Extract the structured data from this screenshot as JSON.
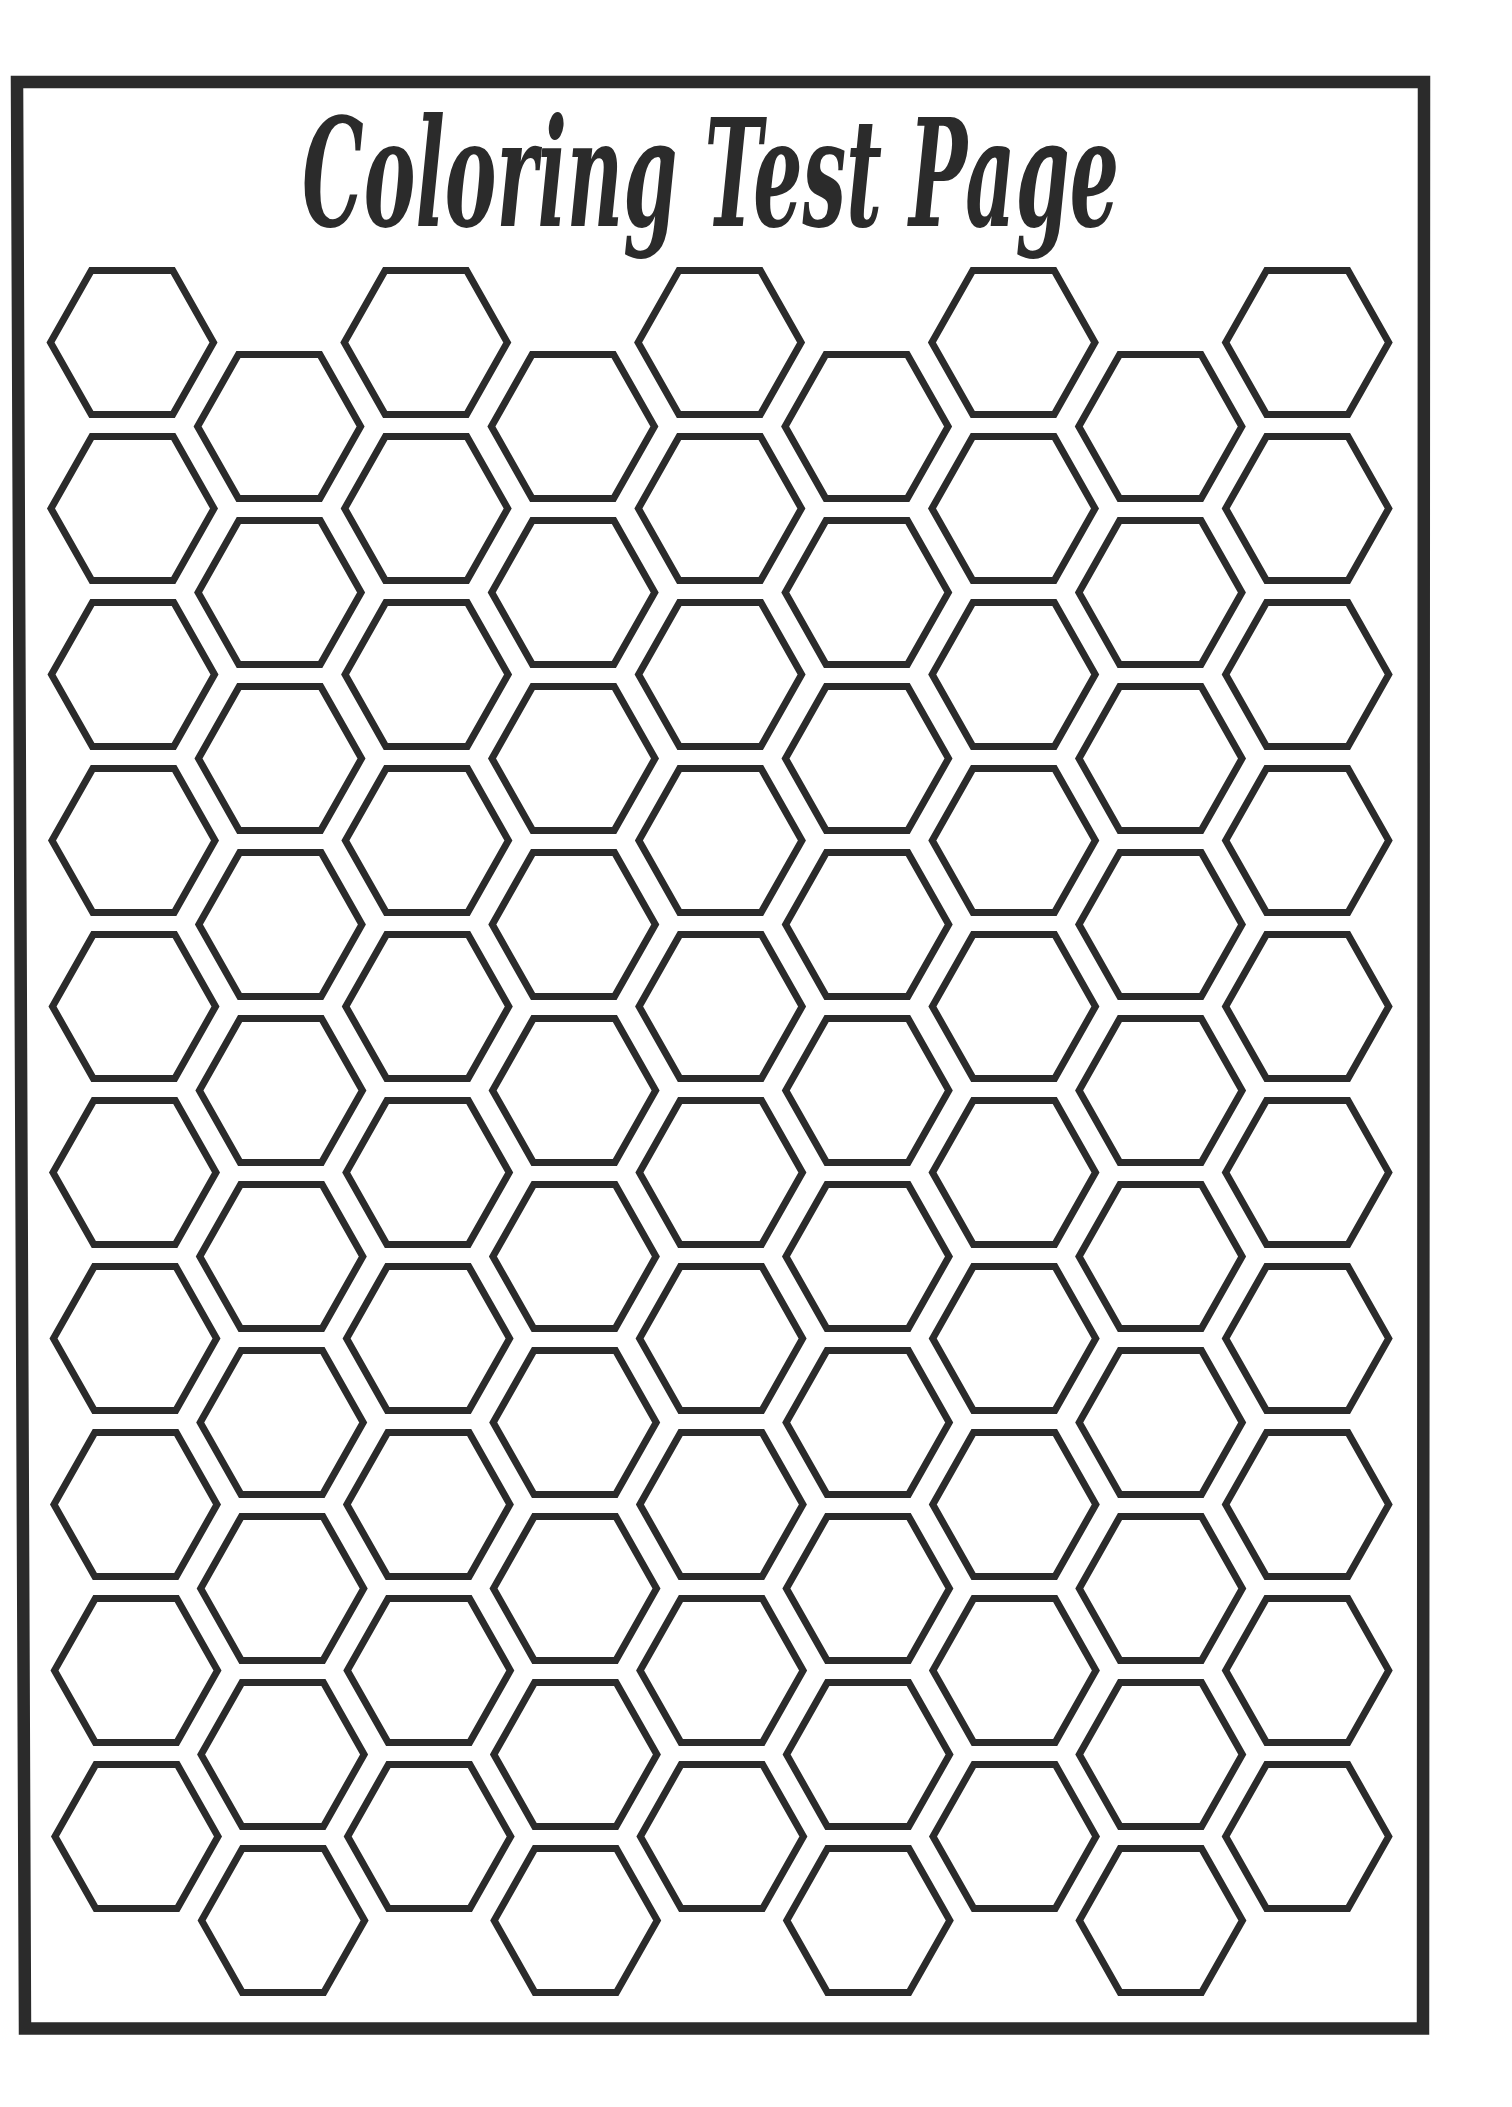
{
  "page": {
    "title": "Coloring Test Page",
    "colors": {
      "ink": "#2b2b2b",
      "paper": "#ffffff"
    }
  },
  "frame": {
    "points": [
      [
        17,
        82
      ],
      [
        1424,
        82
      ],
      [
        1423,
        2028.5
      ],
      [
        25,
        2028.5
      ]
    ],
    "stroke_width": 12.5
  },
  "title_layout": {
    "x": 302,
    "baseline_y": 226,
    "width": 817
  },
  "hex_grid": {
    "columns": 9,
    "rows_per_column": 10,
    "total_cells": 90,
    "first_center_x": 132,
    "column_spacing_x": 146.9,
    "odd_column_first_center_y": 342.5,
    "even_column_first_center_y": 426.5,
    "row_spacing_y": 166,
    "half_width": 81.5,
    "half_height": 72,
    "stroke_width": 7,
    "left_drift_px": 4.5
  }
}
